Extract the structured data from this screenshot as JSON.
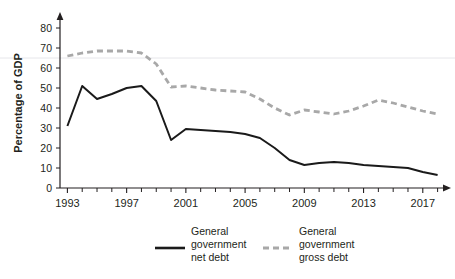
{
  "chart_data": {
    "type": "line",
    "title": "",
    "xlabel": "",
    "ylabel": "Percentage of GDP",
    "ylim": [
      0,
      85
    ],
    "xlim": [
      1992.5,
      2018.5
    ],
    "yticks": [
      0,
      10,
      20,
      30,
      40,
      50,
      60,
      70,
      80
    ],
    "ytick_labels": [
      "0",
      "10",
      "20",
      "30",
      "40",
      "50",
      "60",
      "70",
      "80"
    ],
    "xticks": [
      1993,
      1997,
      2001,
      2005,
      2009,
      2013,
      2017
    ],
    "xtick_labels": [
      "1993",
      "1997",
      "2001",
      "2005",
      "2009",
      "2013",
      "2017"
    ],
    "x_minor_ticks": [
      1994,
      1995,
      1996,
      1998,
      1999,
      2000,
      2002,
      2003,
      2004,
      2006,
      2007,
      2008,
      2010,
      2011,
      2012,
      2014,
      2015,
      2016,
      2018
    ],
    "grid": "faint-horizontal",
    "gridlines": [
      65
    ],
    "legend_position": "bottom",
    "x": [
      1993,
      1994,
      1995,
      1996,
      1997,
      1998,
      1999,
      2000,
      2001,
      2002,
      2003,
      2004,
      2005,
      2006,
      2007,
      2008,
      2009,
      2010,
      2011,
      2012,
      2013,
      2014,
      2015,
      2016,
      2017,
      2018
    ],
    "series": [
      {
        "name": "General government net debt",
        "style": "solid",
        "color": "#1a1a1a",
        "values": [
          31.0,
          51.0,
          44.5,
          47.0,
          50.0,
          51.0,
          43.5,
          24.0,
          29.5,
          29.0,
          28.5,
          28.0,
          27.0,
          25.0,
          20.0,
          14.0,
          11.5,
          12.5,
          13.0,
          12.5,
          11.5,
          11.0,
          10.5,
          10.0,
          8.0,
          6.5
        ]
      },
      {
        "name": "General government gross debt",
        "style": "dashed",
        "color": "#a8a8a8",
        "values": [
          66.0,
          67.5,
          68.5,
          68.5,
          68.5,
          67.5,
          62.0,
          50.5,
          51.0,
          50.0,
          49.0,
          48.5,
          48.0,
          44.5,
          40.0,
          36.5,
          39.0,
          38.0,
          37.0,
          38.5,
          41.0,
          44.0,
          42.5,
          40.5,
          38.5,
          37.0
        ]
      }
    ]
  },
  "legend": {
    "items": [
      {
        "label_line1": "General",
        "label_line2": "government",
        "label_line3": "net debt",
        "style": "solid",
        "color": "#1a1a1a"
      },
      {
        "label_line1": "General",
        "label_line2": "government",
        "label_line3": "gross debt",
        "style": "dashed",
        "color": "#a8a8a8"
      }
    ]
  }
}
